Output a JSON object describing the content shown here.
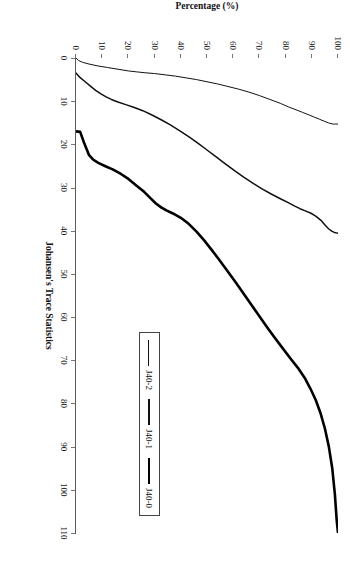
{
  "chart_data": {
    "type": "line",
    "title": "",
    "xlabel": "Johansen's Trace Statistics",
    "ylabel": "Percentage (%)",
    "xlim": [
      0,
      110
    ],
    "ylim": [
      0,
      100
    ],
    "grid": false,
    "legend_position": "right",
    "xticks": [
      0,
      10,
      20,
      30,
      40,
      50,
      60,
      70,
      80,
      90,
      100,
      110
    ],
    "yticks": [
      0,
      10,
      20,
      30,
      40,
      50,
      60,
      70,
      80,
      90,
      100
    ],
    "series": [
      {
        "name": "J40-2",
        "style": "thin",
        "points": [
          [
            0.0,
            0.0
          ],
          [
            0.6,
            1.0
          ],
          [
            1.0,
            2.5
          ],
          [
            1.4,
            5.0
          ],
          [
            1.8,
            8.0
          ],
          [
            2.2,
            12.0
          ],
          [
            2.6,
            16.0
          ],
          [
            3.0,
            20.0
          ],
          [
            3.2,
            23.0
          ],
          [
            3.4,
            26.0
          ],
          [
            3.6,
            30.0
          ],
          [
            3.9,
            34.0
          ],
          [
            4.2,
            38.0
          ],
          [
            4.6,
            42.0
          ],
          [
            5.0,
            46.0
          ],
          [
            5.5,
            50.0
          ],
          [
            6.0,
            54.0
          ],
          [
            6.6,
            58.0
          ],
          [
            7.2,
            62.0
          ],
          [
            7.9,
            66.0
          ],
          [
            8.7,
            70.0
          ],
          [
            9.6,
            74.0
          ],
          [
            10.5,
            78.0
          ],
          [
            11.3,
            81.0
          ],
          [
            12.0,
            84.0
          ],
          [
            12.6,
            86.5
          ],
          [
            13.2,
            89.0
          ],
          [
            13.7,
            91.0
          ],
          [
            14.2,
            93.0
          ],
          [
            14.7,
            95.0
          ],
          [
            15.0,
            96.3
          ],
          [
            15.2,
            97.3
          ],
          [
            15.3,
            98.2
          ],
          [
            15.3,
            99.0
          ],
          [
            15.3,
            99.6
          ],
          [
            15.3,
            100.0
          ]
        ]
      },
      {
        "name": "J40-1",
        "style": "medium",
        "points": [
          [
            3.5,
            0.0
          ],
          [
            4.5,
            1.5
          ],
          [
            5.5,
            3.5
          ],
          [
            6.5,
            5.5
          ],
          [
            7.5,
            7.5
          ],
          [
            8.3,
            9.5
          ],
          [
            9.0,
            11.5
          ],
          [
            9.6,
            13.5
          ],
          [
            10.2,
            16.0
          ],
          [
            10.8,
            19.0
          ],
          [
            11.4,
            22.0
          ],
          [
            12.2,
            25.5
          ],
          [
            13.2,
            29.0
          ],
          [
            14.3,
            32.5
          ],
          [
            15.5,
            36.0
          ],
          [
            16.8,
            39.5
          ],
          [
            18.2,
            43.0
          ],
          [
            19.7,
            46.5
          ],
          [
            21.3,
            50.0
          ],
          [
            22.9,
            53.5
          ],
          [
            24.5,
            57.0
          ],
          [
            26.1,
            60.5
          ],
          [
            27.6,
            64.0
          ],
          [
            29.0,
            67.5
          ],
          [
            30.3,
            71.0
          ],
          [
            31.5,
            74.5
          ],
          [
            32.6,
            78.0
          ],
          [
            33.5,
            81.0
          ],
          [
            34.3,
            83.5
          ],
          [
            34.9,
            85.5
          ],
          [
            35.4,
            87.5
          ],
          [
            35.9,
            89.5
          ],
          [
            36.6,
            91.5
          ],
          [
            37.6,
            93.5
          ],
          [
            38.8,
            95.2
          ],
          [
            39.6,
            96.5
          ],
          [
            40.1,
            97.6
          ],
          [
            40.4,
            98.6
          ],
          [
            40.5,
            99.4
          ],
          [
            40.6,
            100.0
          ]
        ]
      },
      {
        "name": "J40-0",
        "style": "thick",
        "points": [
          [
            17.0,
            0.0
          ],
          [
            17.1,
            1.6
          ],
          [
            19.5,
            3.0
          ],
          [
            21.0,
            4.0
          ],
          [
            22.5,
            5.0
          ],
          [
            23.5,
            6.5
          ],
          [
            24.3,
            8.5
          ],
          [
            25.0,
            11.0
          ],
          [
            25.8,
            14.0
          ],
          [
            26.8,
            17.0
          ],
          [
            28.0,
            20.0
          ],
          [
            29.5,
            23.0
          ],
          [
            31.0,
            26.0
          ],
          [
            32.5,
            28.5
          ],
          [
            33.7,
            30.5
          ],
          [
            34.6,
            32.5
          ],
          [
            35.3,
            34.5
          ],
          [
            36.0,
            37.0
          ],
          [
            37.0,
            40.0
          ],
          [
            38.4,
            43.0
          ],
          [
            40.2,
            46.0
          ],
          [
            42.3,
            49.0
          ],
          [
            44.6,
            52.0
          ],
          [
            47.0,
            55.0
          ],
          [
            49.5,
            58.0
          ],
          [
            52.0,
            61.0
          ],
          [
            54.6,
            64.0
          ],
          [
            57.2,
            67.0
          ],
          [
            59.8,
            70.0
          ],
          [
            62.4,
            73.0
          ],
          [
            64.9,
            76.0
          ],
          [
            67.3,
            79.0
          ],
          [
            69.7,
            82.0
          ],
          [
            72.0,
            85.0
          ],
          [
            74.3,
            87.5
          ],
          [
            76.6,
            89.5
          ],
          [
            79.2,
            91.5
          ],
          [
            82.2,
            93.3
          ],
          [
            85.8,
            95.0
          ],
          [
            90.0,
            96.5
          ],
          [
            95.0,
            97.8
          ],
          [
            101.0,
            98.8
          ],
          [
            107.0,
            99.5
          ],
          [
            110.0,
            100.0
          ]
        ]
      }
    ]
  },
  "axes": {
    "x_title": "Johansen's Trace Statistics",
    "y_title": "Percentage (%)",
    "x_ticklabels": [
      "0",
      "10",
      "20",
      "30",
      "40",
      "50",
      "60",
      "70",
      "80",
      "90",
      "100",
      "110"
    ],
    "y_ticklabels": [
      "0",
      "10",
      "20",
      "30",
      "40",
      "50",
      "60",
      "70",
      "80",
      "90",
      "100"
    ]
  },
  "legend": {
    "items": [
      {
        "label": "J40-2",
        "style": "thin"
      },
      {
        "label": "J40-1",
        "style": "med"
      },
      {
        "label": "J40-0",
        "style": "thick"
      }
    ]
  },
  "colors": {
    "curve": "#111111",
    "axis": "#777777",
    "background": "#ffffff"
  }
}
